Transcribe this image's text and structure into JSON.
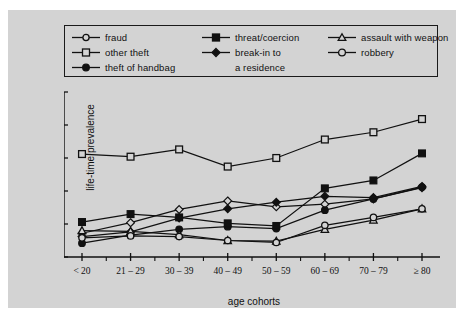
{
  "figure": {
    "background_color": "#d3d3d3",
    "page_color": "#ffffff"
  },
  "chart_data": {
    "type": "line",
    "title": "",
    "xlabel": "age cohorts",
    "ylabel": "life-time prevalence",
    "categories": [
      "< 20",
      "21 – 29",
      "30 – 39",
      "40 – 49",
      "50 – 59",
      "60 – 69",
      "70 – 79",
      "≥ 80"
    ],
    "ylim": [
      0,
      25
    ],
    "yticks": [
      0,
      5,
      10,
      15,
      20,
      25
    ],
    "ytick_labels": [
      "0",
      "5",
      "10",
      "15",
      "20",
      "25"
    ],
    "grid": false,
    "legend_position": "top",
    "series": [
      {
        "name": "fraud",
        "marker": "open-diamond",
        "values": [
          3.6,
          5.2,
          7.2,
          8.5,
          7.6,
          8.0,
          8.8,
          10.5
        ]
      },
      {
        "name": "other theft",
        "marker": "open-square",
        "values": [
          15.6,
          15.2,
          16.3,
          13.7,
          15.0,
          17.8,
          18.9,
          20.9
        ]
      },
      {
        "name": "theft of handbag",
        "marker": "filled-circle",
        "values": [
          2.1,
          3.3,
          4.2,
          4.6,
          4.3,
          7.1,
          8.8,
          10.6
        ]
      },
      {
        "name": "threat/coercion",
        "marker": "filled-square",
        "values": [
          5.3,
          6.5,
          6.0,
          5.1,
          4.7,
          10.4,
          11.6,
          15.7
        ]
      },
      {
        "name": "break-in to a residence",
        "marker": "filled-diamond",
        "values": [
          3.1,
          3.8,
          5.9,
          7.3,
          8.3,
          9.2,
          9.0,
          10.7
        ]
      },
      {
        "name": "assault with weapon",
        "marker": "open-triangle",
        "values": [
          4.0,
          3.9,
          3.4,
          2.5,
          2.4,
          4.2,
          5.6,
          7.3
        ]
      },
      {
        "name": "robbery",
        "marker": "open-circle",
        "values": [
          2.9,
          3.2,
          3.1,
          2.5,
          2.2,
          4.8,
          6.0,
          7.3
        ]
      }
    ]
  },
  "legend": {
    "columns": [
      [
        {
          "label": "fraud",
          "marker": "open-circle"
        },
        {
          "label": "other theft",
          "marker": "open-square"
        },
        {
          "label": "theft of handbag",
          "marker": "filled-circle"
        }
      ],
      [
        {
          "label": "threat/coercion",
          "marker": "filled-square"
        },
        {
          "label": "break-in to",
          "marker": "filled-diamond"
        },
        {
          "label": "a residence",
          "marker": "none"
        }
      ],
      [
        {
          "label": "assault with weapon",
          "marker": "open-triangle"
        },
        {
          "label": "robbery",
          "marker": "open-circle"
        },
        {
          "label": "",
          "marker": "none"
        }
      ]
    ]
  }
}
